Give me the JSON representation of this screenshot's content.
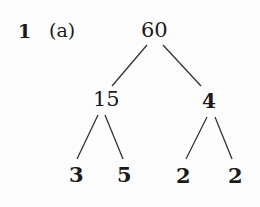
{
  "question": {
    "number": "1",
    "part": "(a)"
  },
  "tree": {
    "root": "60",
    "level1": [
      {
        "value": "15",
        "bold": false
      },
      {
        "value": "4",
        "bold": true
      }
    ],
    "level2": [
      {
        "value": "3",
        "bold": true
      },
      {
        "value": "5",
        "bold": true
      },
      {
        "value": "2",
        "bold": true
      },
      {
        "value": "2",
        "bold": true
      }
    ]
  },
  "colors": {
    "ink": "#1a1a1a",
    "background": "#fdfdfd"
  }
}
